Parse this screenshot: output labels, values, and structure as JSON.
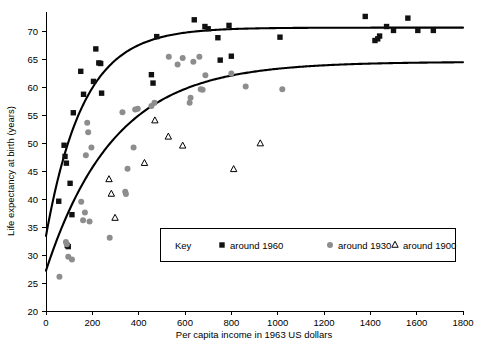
{
  "chart_data": {
    "type": "scatter",
    "title": "",
    "xlabel": "Per capita income in 1963 US dollars",
    "ylabel": "Life expectancy at birth (years)",
    "xlim": [
      0,
      1800
    ],
    "ylim": [
      20,
      72
    ],
    "xticks": [
      0,
      200,
      400,
      600,
      800,
      1000,
      1200,
      1400,
      1600,
      1800
    ],
    "yticks": [
      20,
      25,
      30,
      35,
      40,
      45,
      50,
      55,
      60,
      65,
      70
    ],
    "grid": false,
    "legend_position": "inside-lower-center",
    "legend_title": "Key",
    "series": [
      {
        "name": "around 1960",
        "marker": "square",
        "color": "#111111",
        "points": [
          [
            55,
            39.6
          ],
          [
            78,
            49.6
          ],
          [
            82,
            47.6
          ],
          [
            88,
            46.4
          ],
          [
            92,
            31.7
          ],
          [
            96,
            31.5
          ],
          [
            104,
            42.8
          ],
          [
            112,
            37.2
          ],
          [
            118,
            55.4
          ],
          [
            150,
            62.8
          ],
          [
            162,
            58.7
          ],
          [
            205,
            61.0
          ],
          [
            215,
            66.8
          ],
          [
            228,
            64.3
          ],
          [
            236,
            64.2
          ],
          [
            240,
            58.9
          ],
          [
            455,
            62.2
          ],
          [
            462,
            60.7
          ],
          [
            478,
            69.0
          ],
          [
            640,
            72.0
          ],
          [
            686,
            70.8
          ],
          [
            700,
            70.4
          ],
          [
            742,
            68.8
          ],
          [
            752,
            64.8
          ],
          [
            790,
            71.0
          ],
          [
            800,
            65.5
          ],
          [
            1010,
            68.9
          ],
          [
            1378,
            72.6
          ],
          [
            1420,
            68.3
          ],
          [
            1432,
            68.6
          ],
          [
            1440,
            69.1
          ],
          [
            1470,
            70.8
          ],
          [
            1500,
            70.1
          ],
          [
            1562,
            72.3
          ],
          [
            1605,
            70.1
          ],
          [
            1672,
            70.1
          ]
        ]
      },
      {
        "name": "around 1930",
        "marker": "circle",
        "color": "#8d8d8d",
        "points": [
          [
            58,
            26.1
          ],
          [
            86,
            32.3
          ],
          [
            90,
            31.9
          ],
          [
            96,
            29.7
          ],
          [
            112,
            29.2
          ],
          [
            152,
            39.5
          ],
          [
            160,
            36.2
          ],
          [
            168,
            37.6
          ],
          [
            172,
            47.8
          ],
          [
            178,
            53.6
          ],
          [
            182,
            51.9
          ],
          [
            188,
            36.0
          ],
          [
            196,
            49.2
          ],
          [
            275,
            33.1
          ],
          [
            330,
            55.5
          ],
          [
            342,
            41.3
          ],
          [
            345,
            40.9
          ],
          [
            352,
            45.4
          ],
          [
            378,
            49.2
          ],
          [
            385,
            56.0
          ],
          [
            396,
            56.1
          ],
          [
            455,
            56.6
          ],
          [
            468,
            57.2
          ],
          [
            530,
            65.4
          ],
          [
            568,
            64.0
          ],
          [
            590,
            65.2
          ],
          [
            620,
            57.2
          ],
          [
            624,
            58.1
          ],
          [
            636,
            64.5
          ],
          [
            662,
            65.4
          ],
          [
            668,
            59.6
          ],
          [
            676,
            59.5
          ],
          [
            688,
            62.1
          ],
          [
            800,
            62.4
          ],
          [
            862,
            60.1
          ],
          [
            1020,
            59.6
          ]
        ]
      },
      {
        "name": "around 1900",
        "marker": "triangle",
        "color": "#000000",
        "points": [
          [
            272,
            43.5
          ],
          [
            282,
            40.9
          ],
          [
            298,
            36.6
          ],
          [
            425,
            46.4
          ],
          [
            470,
            54.0
          ],
          [
            528,
            51.1
          ],
          [
            590,
            49.5
          ],
          [
            810,
            45.3
          ],
          [
            925,
            49.9
          ]
        ]
      }
    ],
    "fit_curves": [
      {
        "name": "fit-1960",
        "asymptote": 70.6,
        "y_intercept": 33.4,
        "description": "Saturating curve for around 1960"
      },
      {
        "name": "fit-1930",
        "asymptote": 64.5,
        "y_intercept": 27.2,
        "description": "Saturating curve for around 1930"
      }
    ]
  },
  "legend": {
    "title": "Key",
    "entries": [
      {
        "label": "around 1960",
        "marker": "square",
        "color": "#111111"
      },
      {
        "label": "around 1930",
        "marker": "circle",
        "color": "#8d8d8d"
      },
      {
        "label": "around 1900",
        "marker": "triangle",
        "color": "#000000"
      }
    ]
  }
}
